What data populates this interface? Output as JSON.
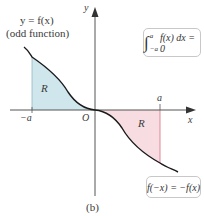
{
  "figure": {
    "caption": "(b)",
    "function_label": "y = f(x)",
    "function_note": "(odd function)",
    "axes": {
      "x_label": "x",
      "y_label": "y",
      "origin_label": "O"
    },
    "ticks": {
      "neg_a": "−a",
      "pos_a": "a"
    },
    "regions": [
      {
        "label": "R",
        "side": "left",
        "color": "#cfe6ec"
      },
      {
        "label": "R",
        "side": "right",
        "color": "#f7dde2"
      }
    ],
    "integral_box": {
      "int_upper": "a",
      "int_lower": "−a",
      "integrand": "f(x) dx = 0"
    },
    "odd_box": {
      "text": "f(−x) = −f(x)"
    },
    "colors": {
      "curve": "#1a1a1a",
      "axis": "#555555",
      "left_fill": "#cfe6ec",
      "right_fill": "#f7dde2",
      "right_edge": "#e07a8a",
      "left_edge": "#8fb8c4"
    }
  }
}
